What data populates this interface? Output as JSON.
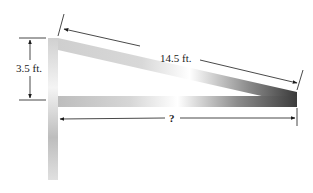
{
  "diagram": {
    "labels": {
      "height": "3.5 ft.",
      "slant": "14.5 ft.",
      "unknown": "?"
    },
    "colors": {
      "line": "#1a1a1a",
      "beam_light": "#e8e8e8",
      "beam_dark": "#3a3a3a",
      "post": "#c8c8c8"
    }
  }
}
